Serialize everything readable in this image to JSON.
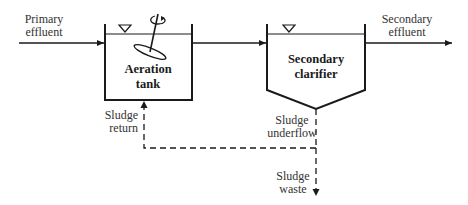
{
  "diagram": {
    "type": "process-flow",
    "title": "",
    "colors": {
      "line": "#1a1a1a",
      "text": "#333333",
      "background": "#ffffff"
    },
    "nodes": [
      {
        "id": "aeration_tank",
        "label_line1": "Aeration",
        "label_line2": "tank",
        "shape": "rectangle-open-top",
        "has_aerator": true,
        "has_water_level": true
      },
      {
        "id": "secondary_clarifier",
        "label_line1": "Secondary",
        "label_line2": "clarifier",
        "shape": "pentagon-hopper-bottom",
        "has_water_level": true
      }
    ],
    "flows": [
      {
        "id": "primary_effluent",
        "label_line1": "Primary",
        "label_line2": "effluent",
        "from": "",
        "to": "aeration_tank",
        "style": "solid"
      },
      {
        "id": "tank_to_clarifier",
        "from": "aeration_tank",
        "to": "secondary_clarifier",
        "style": "solid"
      },
      {
        "id": "secondary_effluent",
        "label_line1": "Secondary",
        "label_line2": "effluent",
        "from": "secondary_clarifier",
        "to": "",
        "style": "solid"
      },
      {
        "id": "sludge_underflow",
        "label_line1": "Sludge",
        "label_line2": "underflow",
        "from": "secondary_clarifier",
        "to": "junction",
        "style": "dashed"
      },
      {
        "id": "sludge_return",
        "label_line1": "Sludge",
        "label_line2": "return",
        "from": "junction",
        "to": "aeration_tank",
        "style": "dashed"
      },
      {
        "id": "sludge_waste",
        "label_line1": "Sludge",
        "label_line2": "waste",
        "from": "junction",
        "to": "",
        "style": "dashed"
      }
    ]
  }
}
